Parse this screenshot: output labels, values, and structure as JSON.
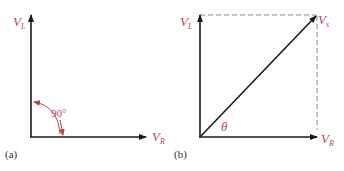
{
  "colors": {
    "axis": "#1a1a1a",
    "label": "#b5484f",
    "dashed": "#8a8a8a",
    "caption": "#333333"
  },
  "panel_a": {
    "caption": "(a)",
    "vertical_label": {
      "main": "V",
      "sub": "L"
    },
    "horizontal_label": {
      "main": "V",
      "sub": "R"
    },
    "angle_label": "90°"
  },
  "panel_b": {
    "caption": "(b)",
    "vertical_label": {
      "main": "V",
      "sub": "L"
    },
    "horizontal_label": {
      "main": "V",
      "sub": "R"
    },
    "resultant_label": {
      "main": "V",
      "sub": "s"
    },
    "angle_label": "θ"
  }
}
